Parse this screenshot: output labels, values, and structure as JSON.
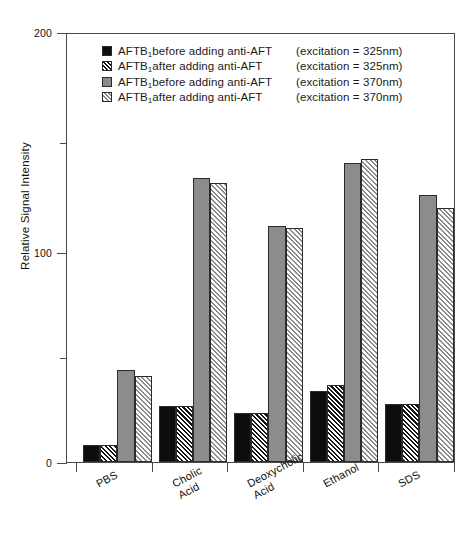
{
  "chart_data": {
    "type": "bar",
    "title": "",
    "xlabel": "",
    "ylabel": "Relative Signal Intensity",
    "ylim": [
      0,
      200
    ],
    "yticks": [
      0,
      100,
      200
    ],
    "yticks_minor": [
      50,
      150
    ],
    "grid": false,
    "legend_position": "top-center",
    "categories": [
      "PBS",
      "Cholic\nAcid",
      "Deoxycholic\nAcid",
      "Ethanol",
      "SDS"
    ],
    "series": [
      {
        "name": "AFTB1 before adding anti-AFT (excitation = 325nm)",
        "pattern": "solid-black",
        "values": [
          8,
          26,
          23,
          33,
          27
        ]
      },
      {
        "name": "AFTB1 after adding anti-AFT (excitation = 325nm)",
        "pattern": "dark-hatch",
        "values": [
          8,
          26,
          23,
          36,
          27
        ]
      },
      {
        "name": "AFTB1 before adding anti-AFT (excitation = 370nm)",
        "pattern": "solid-gray",
        "values": [
          43,
          132,
          110,
          139,
          124
        ]
      },
      {
        "name": "AFTB1 after adding anti-AFT (excitation = 370nm)",
        "pattern": "light-hatch",
        "values": [
          40,
          130,
          109,
          141,
          118
        ]
      }
    ]
  },
  "legend": {
    "rows": [
      {
        "main": "AFTB",
        "sub": "1",
        "rest": "before adding anti-AFT",
        "excitation": "(excitation = 325nm)"
      },
      {
        "main": "AFTB",
        "sub": "1",
        "rest": "after adding anti-AFT",
        "excitation": "(excitation = 325nm)"
      },
      {
        "main": "AFTB",
        "sub": "1",
        "rest": "before adding anti-AFT",
        "excitation": "(excitation = 370nm)"
      },
      {
        "main": "AFTB",
        "sub": "1",
        "rest": "after adding anti-AFT",
        "excitation": "(excitation = 370nm)"
      }
    ]
  },
  "axis": {
    "y_title": "Relative Signal Intensity",
    "y_labels": [
      "200",
      "100",
      "0"
    ]
  }
}
